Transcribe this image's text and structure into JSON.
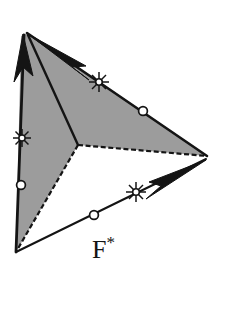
{
  "figure": {
    "label": {
      "base": "F",
      "superscript": "*",
      "full": "F*"
    },
    "colors": {
      "background": "#ffffff",
      "shaded_region": "#9c9c9c",
      "stroke": "#141414",
      "marker_fill": "#ffffff"
    },
    "canvas": {
      "width": 227,
      "height": 309
    },
    "vertices": {
      "top_left": [
        27,
        33
      ],
      "bottom_left": [
        16,
        252
      ],
      "right": [
        207,
        156
      ],
      "notch": [
        78,
        145
      ]
    },
    "shaded_polygon_points": "27,33 207,156 78,145 16,252 21,36",
    "edges": [
      {
        "name": "upper-edge",
        "from": [
          27,
          33
        ],
        "to": [
          207,
          156
        ],
        "style": "solid"
      },
      {
        "name": "notch-to-right-edge",
        "from": [
          78,
          145
        ],
        "to": [
          207,
          156
        ],
        "style": "dashed"
      },
      {
        "name": "notch-to-bottom-left-edge",
        "from": [
          78,
          145
        ],
        "to": [
          16,
          252
        ],
        "style": "dashed"
      },
      {
        "name": "left-edge",
        "from": [
          27,
          33
        ],
        "to": [
          16,
          252
        ],
        "style": "solid"
      },
      {
        "name": "interior-diagonal",
        "from": [
          27,
          33
        ],
        "to": [
          78,
          145
        ],
        "style": "solid"
      },
      {
        "name": "bottom-edge",
        "from": [
          16,
          252
        ],
        "to": [
          207,
          156
        ],
        "style": "solid"
      }
    ],
    "arrows": [
      {
        "name": "vertical-arrow",
        "tail": [
          21,
          188
        ],
        "tip": [
          23,
          36
        ]
      },
      {
        "name": "upper-diagonal-arrow",
        "tail": [
          93,
          73
        ],
        "tip": [
          29,
          35
        ]
      },
      {
        "name": "lower-diagonal-arrow",
        "tail": [
          144,
          196
        ],
        "tip": [
          206,
          160
        ]
      }
    ],
    "markers": {
      "asterisk": [
        {
          "name": "asterisk-marker-left",
          "cx": 22,
          "cy": 138
        },
        {
          "name": "asterisk-marker-upper",
          "cx": 99,
          "cy": 82
        },
        {
          "name": "asterisk-marker-lower",
          "cx": 136,
          "cy": 192
        }
      ],
      "circle": [
        {
          "name": "circle-marker-left",
          "cx": 21,
          "cy": 185
        },
        {
          "name": "circle-marker-upper",
          "cx": 143,
          "cy": 111
        },
        {
          "name": "circle-marker-lower",
          "cx": 94,
          "cy": 215
        }
      ]
    }
  }
}
